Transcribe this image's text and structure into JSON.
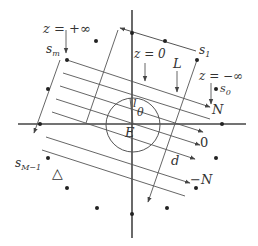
{
  "figure": {
    "colors": {
      "line": "#555555",
      "axis": "#444444",
      "dot": "#222222",
      "text": "#333333",
      "background": "#ffffff"
    }
  },
  "labels": {
    "z_plus_inf": "z = +∞",
    "z_zero": "z = 0",
    "z_minus_inf": "z = −∞",
    "s_m": "s",
    "s_m_sub": "m",
    "s_1": "s",
    "s_1_sub": "1",
    "s_0": "s",
    "s_0_sub": "0",
    "s_M_minus_1": "s",
    "s_M_minus_1_sub": "M−1",
    "L": "L",
    "N_top": "N",
    "zero": "0",
    "N_bottom": "−N",
    "l": "l",
    "theta": "θ",
    "E": "E",
    "d": "d",
    "delta": "△"
  },
  "geometry": {
    "axis_h": {
      "x1": 18,
      "y1": 124,
      "x2": 246,
      "y2": 124
    },
    "axis_v": {
      "x1": 132,
      "y1": 10,
      "x2": 132,
      "y2": 238
    },
    "circle": {
      "cx": 133,
      "cy": 125,
      "r": 27
    },
    "dots": [
      [
        132,
        33
      ],
      [
        165,
        41
      ],
      [
        197,
        60
      ],
      [
        215,
        89
      ],
      [
        222,
        124
      ],
      [
        216,
        158
      ],
      [
        196,
        188
      ],
      [
        167,
        208
      ],
      [
        132,
        214
      ],
      [
        97,
        208
      ],
      [
        67,
        188
      ],
      [
        48,
        158
      ],
      [
        40,
        124
      ],
      [
        48,
        89
      ],
      [
        67,
        60
      ],
      [
        96,
        41
      ]
    ],
    "rays": [
      {
        "x1": 67,
        "y1": 60,
        "x2": 210,
        "y2": 108
      },
      {
        "x1": 63,
        "y1": 73,
        "x2": 212,
        "y2": 121
      },
      {
        "x1": 60,
        "y1": 86,
        "x2": 209,
        "y2": 134
      },
      {
        "x1": 56,
        "y1": 99,
        "x2": 203,
        "y2": 147
      },
      {
        "x1": 52,
        "y1": 112,
        "x2": 197,
        "y2": 160
      },
      {
        "x1": 47,
        "y1": 137,
        "x2": 190,
        "y2": 183
      }
    ]
  }
}
